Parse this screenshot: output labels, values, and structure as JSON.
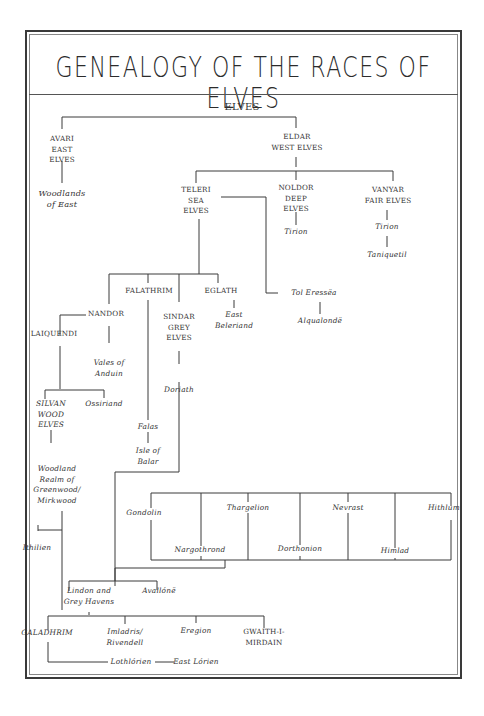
{
  "title": "GENEALOGY OF THE RACES OF ELVES",
  "nodes": {
    "elves": "ELVES",
    "avari": "AVARI\nEAST\nELVES",
    "woodlands_east": "Woodlands\nof East",
    "eldar": "ELDAR\nWEST ELVES",
    "teleri": "TELERI\nSEA\nELVES",
    "noldor": "NOLDOR\nDEEP\nELVES",
    "vanyar": "VANYAR\nFAIR ELVES",
    "tirion_noldor": "Tirion",
    "tirion_vanyar": "Tirion",
    "taniquetil": "Taniquetil",
    "tol_eressea": "Tol Eressëa",
    "alqualonde": "Alqualondë",
    "falathrim": "FALATHRIM",
    "eglath": "EGLATH",
    "east_beleriand": "East\nBeleriand",
    "nandor": "NANDOR",
    "sindar": "SINDAR\nGREY\nELVES",
    "laiquendi": "LAIQUENDI",
    "vales_anduin": "Vales of\nAnduin",
    "ossiriand": "Ossiriand",
    "silvan": "SILVAN\nWOOD\nELVES",
    "doriath": "Doriath",
    "falas": "Falas",
    "isle_balar": "Isle of\nBalar",
    "woodland_realm": "Woodland\nRealm of\nGreenwood/\nMirkwood",
    "ithilien": "Ithilien",
    "gondolin": "Gondolin",
    "thargelion": "Thargelion",
    "nevrast": "Nevrast",
    "hithlum": "Hithlum",
    "nargothrond": "Nargothrond",
    "dorthonion": "Dorthonion",
    "himlad": "Himlad",
    "lindon": "Lindon and\nGrey Havens",
    "avallone": "Avallónë",
    "galadhrim": "GALADHRIM",
    "imladris": "Imladris/\nRivendell",
    "eregion": "Eregion",
    "gwaith": "GWAITH-I-\nMIRDAIN",
    "lothlorien": "Lothlórien",
    "east_lorien": "East Lórien"
  },
  "colors": {
    "line": "#3a3a3a",
    "text": "#333333",
    "frame": "#3a3a3a"
  }
}
